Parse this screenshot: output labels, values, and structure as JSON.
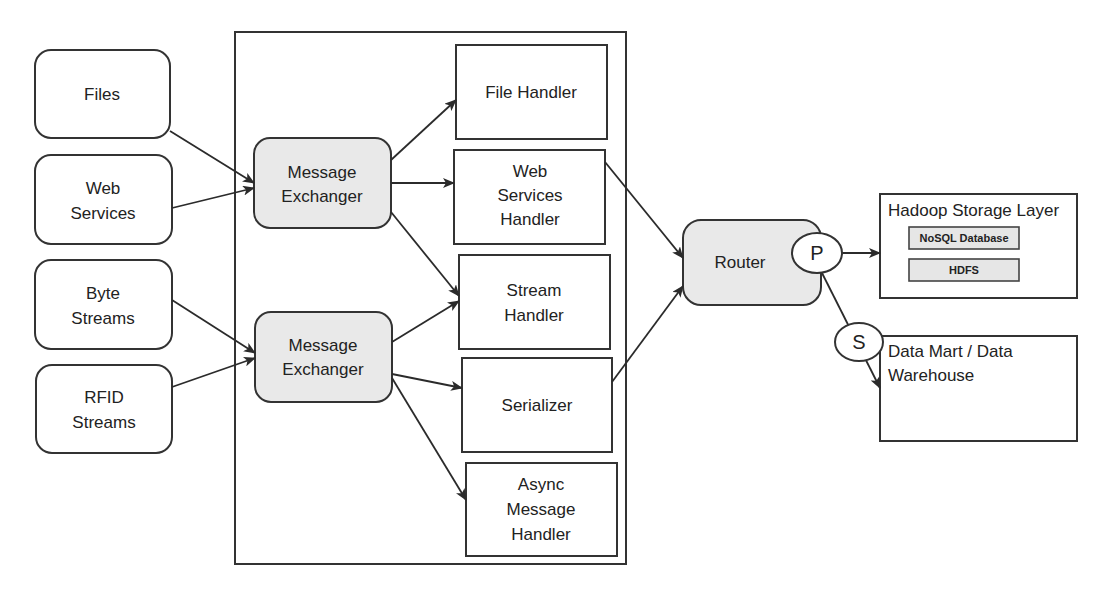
{
  "diagram": {
    "inputs": [
      {
        "id": "files",
        "lines": [
          "Files"
        ]
      },
      {
        "id": "web-services",
        "lines": [
          "Web",
          "Services"
        ]
      },
      {
        "id": "byte-streams",
        "lines": [
          "Byte",
          "Streams"
        ]
      },
      {
        "id": "rfid-streams",
        "lines": [
          "RFID",
          "Streams"
        ]
      }
    ],
    "exchangers": [
      {
        "id": "message-exchanger-1",
        "lines": [
          "Message",
          "Exchanger"
        ]
      },
      {
        "id": "message-exchanger-2",
        "lines": [
          "Message",
          "Exchanger"
        ]
      }
    ],
    "handlers": [
      {
        "id": "file-handler",
        "lines": [
          "File Handler"
        ]
      },
      {
        "id": "web-services-handler",
        "lines": [
          "Web",
          "Services",
          "Handler"
        ]
      },
      {
        "id": "stream-handler",
        "lines": [
          "Stream",
          "Handler"
        ]
      },
      {
        "id": "serializer",
        "lines": [
          "Serializer"
        ]
      },
      {
        "id": "async-message-handler",
        "lines": [
          "Async",
          "Message",
          "Handler"
        ]
      }
    ],
    "router": {
      "label": "Router",
      "primary": "P",
      "secondary": "S"
    },
    "hadoop": {
      "title": "Hadoop Storage Layer",
      "items": [
        "NoSQL Database",
        "HDFS"
      ]
    },
    "data_mart": {
      "lines": [
        "Data Mart / Data",
        "Warehouse"
      ]
    },
    "edges": [
      [
        "Files",
        "Message Exchanger 1"
      ],
      [
        "Web Services",
        "Message Exchanger 1"
      ],
      [
        "Byte Streams",
        "Message Exchanger 2"
      ],
      [
        "RFID Streams",
        "Message Exchanger 2"
      ],
      [
        "Message Exchanger 1",
        "File Handler"
      ],
      [
        "Message Exchanger 1",
        "Web Services Handler"
      ],
      [
        "Message Exchanger 1",
        "Stream Handler"
      ],
      [
        "Message Exchanger 2",
        "Stream Handler"
      ],
      [
        "Message Exchanger 2",
        "Serializer"
      ],
      [
        "Message Exchanger 2",
        "Async Message Handler"
      ],
      [
        "Web Services Handler",
        "Router"
      ],
      [
        "Serializer",
        "Router"
      ],
      [
        "Router (P)",
        "Hadoop Storage Layer"
      ],
      [
        "Router (S)",
        "Data Mart / Data Warehouse"
      ]
    ],
    "colors": {
      "stroke": "#333333",
      "highlight_fill": "#e9e9e9",
      "background": "#ffffff"
    }
  }
}
